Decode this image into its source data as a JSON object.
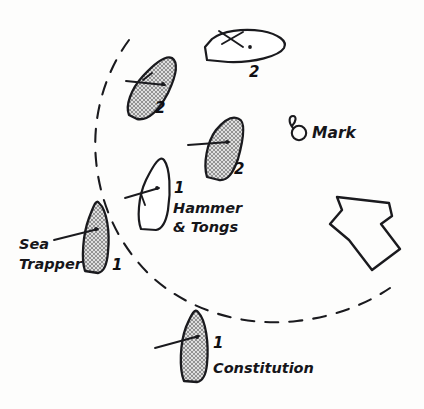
{
  "figure": {
    "kind": "hand-drawn sailing race diagram",
    "background_color": "#fdfdfc",
    "ink_color": "#17171b",
    "hull_fill_color": "#b9b9b9"
  },
  "mark": {
    "label": "Mark",
    "icon": "buoy-mark-icon"
  },
  "zone": {
    "name": "dashed-zone-arc",
    "style": "dashed"
  },
  "wind": {
    "name": "wind-arrow",
    "direction": "up-left"
  },
  "boats": [
    {
      "id": "boat-top-outline",
      "name": "unnamed-boat-top",
      "number": "2",
      "shaded": false,
      "title": ""
    },
    {
      "id": "boat-upper-left",
      "name": "unnamed-boat-upper-left",
      "number": "2",
      "shaded": true,
      "title": ""
    },
    {
      "id": "boat-middle-right",
      "name": "unnamed-boat-middle-right",
      "number": "2",
      "shaded": true,
      "title": ""
    },
    {
      "id": "boat-hammer-tongs",
      "name": "boat-hammer-and-tongs",
      "number": "1",
      "shaded": false,
      "title_line1": "Hammer",
      "title_line2": "& Tongs"
    },
    {
      "id": "boat-sea-trapper",
      "name": "boat-sea-trapper",
      "number": "1",
      "shaded": true,
      "title_line1": "Sea",
      "title_line2": "Trapper"
    },
    {
      "id": "boat-constitution",
      "name": "boat-constitution",
      "number": "1",
      "shaded": true,
      "title": "Constitution"
    }
  ]
}
